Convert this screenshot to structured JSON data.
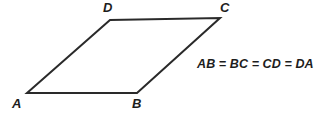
{
  "figure": {
    "type": "geometry-diagram",
    "shape_name": "rhombus",
    "background_color": "#ffffff",
    "stroke_color": "#2a2a2a",
    "stroke_width": 2,
    "vertices": [
      {
        "id": "A",
        "label": "A",
        "x": 27,
        "y": 93,
        "label_x": 12,
        "label_y": 97
      },
      {
        "id": "B",
        "label": "B",
        "x": 137,
        "y": 93,
        "label_x": 132,
        "label_y": 97
      },
      {
        "id": "C",
        "label": "C",
        "x": 220,
        "y": 18,
        "label_x": 220,
        "label_y": 1
      },
      {
        "id": "D",
        "label": "D",
        "x": 110,
        "y": 20,
        "label_x": 103,
        "label_y": 1
      }
    ],
    "edges": [
      {
        "id": "AB",
        "from": "A",
        "to": "B"
      },
      {
        "id": "BC",
        "from": "B",
        "to": "C"
      },
      {
        "id": "CD",
        "from": "C",
        "to": "D"
      },
      {
        "id": "DA",
        "from": "D",
        "to": "A"
      }
    ],
    "path_points": "27,93 137,93 220,18 110,20",
    "annotation": "AB = BC = CD = DA",
    "watermark_text": ""
  }
}
